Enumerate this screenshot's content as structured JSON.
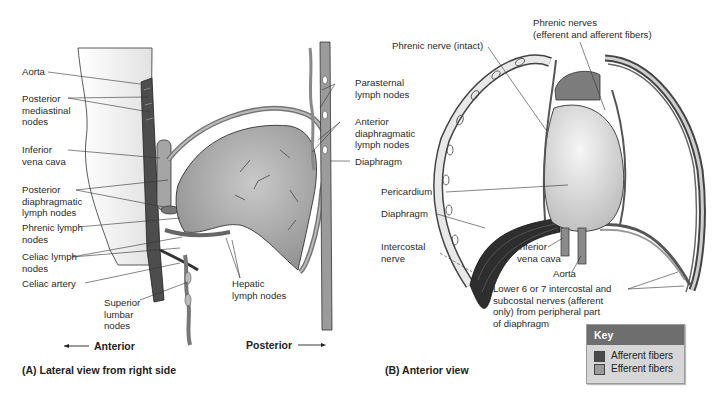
{
  "panel_a": {
    "caption": "(A)  Lateral view from right side",
    "direction_anterior": "Anterior",
    "direction_posterior": "Posterior",
    "labels": {
      "aorta": "Aorta",
      "posterior_mediastinal_nodes": "Posterior\nmediastinal\nnodes",
      "inferior_vena_cava": "Inferior\nvena cava",
      "posterior_diaphragmatic_lymph_nodes": "Posterior\ndiaphragmatic\nlymph nodes",
      "phrenic_lymph_nodes": "Phrenic lymph\nnodes",
      "celiac_lymph_nodes": "Celiac lymph\nnodes",
      "celiac_artery": "Celiac artery",
      "superior_lumbar_nodes": "Superior\nlumbar\nnodes",
      "hepatic_lymph_nodes": "Hepatic\nlymph nodes",
      "parasternal_lymph_nodes": "Parasternal\nlymph nodes",
      "anterior_diaphragmatic_lymph_nodes": "Anterior\ndiaphragmatic\nlymph nodes",
      "diaphragm": "Diaphragm"
    }
  },
  "panel_b": {
    "caption": "(B)  Anterior view",
    "labels": {
      "phrenic_nerve_intact": "Phrenic nerve (intact)",
      "phrenic_nerves": "Phrenic nerves\n(efferent and afferent fibers)",
      "pericardium": "Pericardium",
      "diaphragm": "Diaphragm",
      "intercostal_nerve": "Intercostal\nnerve",
      "inferior_vena_cava": "Inferior\nvena cava",
      "aorta": "Aorta",
      "lower_intercostal_nerves": "Lower 6 or 7 intercostal and\nsubcostal nerves (afferent\nonly) from peripheral part\nof diaphragm"
    }
  },
  "key": {
    "title": "Key",
    "items": [
      {
        "label": "Afferent fibers",
        "color": "#4a4a4a"
      },
      {
        "label": "Efferent fibers",
        "color": "#9a9a9a"
      }
    ]
  }
}
